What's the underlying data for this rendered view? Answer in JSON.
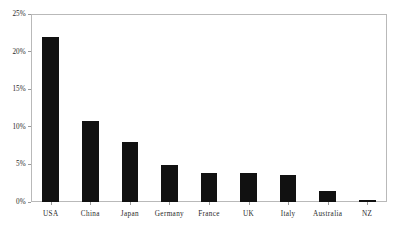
{
  "chart_data": {
    "type": "bar",
    "title": "",
    "xlabel": "",
    "ylabel": "",
    "categories": [
      "USA",
      "China",
      "Japan",
      "Germany",
      "France",
      "UK",
      "Italy",
      "Australia",
      "NZ"
    ],
    "values": [
      21.9,
      10.8,
      8.0,
      4.9,
      3.9,
      3.8,
      3.6,
      1.4,
      0.3
    ],
    "ylim": [
      0,
      25
    ],
    "ytick_values": [
      0,
      5,
      10,
      15,
      20,
      25
    ],
    "ytick_labels": [
      "0%",
      "5%",
      "10%",
      "15%",
      "20%",
      "25%"
    ],
    "grid": false,
    "legend": null,
    "bar_color": "#111111",
    "frame_color": "#b9b9b9",
    "axis_text_color": "#2a2a2a",
    "background": "#ffffff"
  }
}
